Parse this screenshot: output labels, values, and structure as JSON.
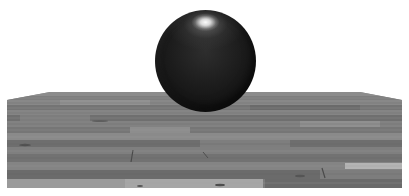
{
  "scene": {
    "description": "3D render of a dark glossy sphere floating above a wooden plank floor",
    "background_color": "#ffffff",
    "sphere": {
      "color": "#1a1a1a",
      "highlight_color": "#ffffff",
      "center": [
        205,
        61
      ],
      "radius": 50
    },
    "floor": {
      "material": "wood planks",
      "base_color": "#7a7a7a",
      "top_edge_y": 92,
      "corner_y": 100,
      "bottom_y": 188,
      "left_x": 7,
      "right_x": 402
    }
  }
}
